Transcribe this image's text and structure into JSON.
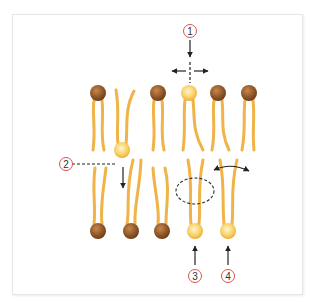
{
  "diagram": {
    "type": "lipid-bilayer-movement",
    "colors": {
      "tail": "#f0b347",
      "head_brown": "#8a5226",
      "head_brown_light": "#c8864a",
      "head_yellow": "#f5c043",
      "head_yellow_light": "#fff3c0",
      "label_circle": "#d9534f",
      "arrow": "#222222"
    },
    "labels": [
      {
        "id": "1",
        "text": "1",
        "x": 190,
        "y": 31
      },
      {
        "id": "2",
        "text": "2",
        "x": 66,
        "y": 164
      },
      {
        "id": "3",
        "text": "3",
        "x": 195,
        "y": 276
      },
      {
        "id": "4",
        "text": "4",
        "x": 228,
        "y": 276
      }
    ],
    "top_leaflet_heads": [
      {
        "x": 98,
        "y": 93,
        "color": "brown"
      },
      {
        "x": 158,
        "y": 93,
        "color": "brown"
      },
      {
        "x": 189,
        "y": 93,
        "color": "yellow"
      },
      {
        "x": 218,
        "y": 93,
        "color": "brown"
      },
      {
        "x": 249,
        "y": 93,
        "color": "brown"
      }
    ],
    "flipped_lipid_head": {
      "x": 122,
      "y": 150,
      "color": "yellow"
    },
    "bottom_leaflet_heads": [
      {
        "x": 98,
        "y": 231,
        "color": "brown"
      },
      {
        "x": 131,
        "y": 231,
        "color": "brown"
      },
      {
        "x": 162,
        "y": 231,
        "color": "brown"
      },
      {
        "x": 195,
        "y": 231,
        "color": "yellow"
      },
      {
        "x": 228,
        "y": 231,
        "color": "yellow"
      }
    ],
    "annotations": {
      "lateral_diffusion": "1",
      "flip_flop": "2",
      "tail_flexion": "3",
      "rotation": "4"
    }
  }
}
